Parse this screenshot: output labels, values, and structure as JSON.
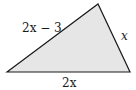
{
  "figure": {
    "type": "triangle",
    "fill_color": "#e6e6e6",
    "stroke_color": "#1a1a1a",
    "vertices": {
      "left": [
        7,
        72
      ],
      "apex": [
        98,
        4
      ],
      "right": [
        130,
        72
      ]
    },
    "labels": {
      "left_side": "2x − 3",
      "right_side": "x",
      "base": "2x"
    }
  }
}
